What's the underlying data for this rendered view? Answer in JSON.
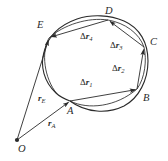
{
  "figure": {
    "background_color": "#ffffff",
    "ink_color": "#2a2a2a",
    "width": 168,
    "height": 161
  },
  "points": [
    {
      "id": "O",
      "label": "O",
      "x": 17,
      "y": 140,
      "label_x": 18,
      "label_y": 144,
      "marker": "dot"
    },
    {
      "id": "A",
      "label": "A",
      "x": 70,
      "y": 101,
      "label_x": 67,
      "label_y": 106,
      "marker": "none"
    },
    {
      "id": "B",
      "label": "B",
      "x": 137,
      "y": 89,
      "label_x": 143,
      "label_y": 93,
      "marker": "none"
    },
    {
      "id": "C",
      "label": "C",
      "x": 144,
      "y": 47,
      "label_x": 150,
      "label_y": 37,
      "marker": "none"
    },
    {
      "id": "D",
      "label": "D",
      "x": 108,
      "y": 20,
      "label_x": 105,
      "label_y": 6,
      "marker": "none"
    },
    {
      "id": "E",
      "label": "E",
      "x": 49,
      "y": 38,
      "label_x": 37,
      "label_y": 20,
      "marker": "none"
    }
  ],
  "displacement_vectors": [
    {
      "id": "dr1",
      "symbol": "Δ",
      "base": "r",
      "subscript": "1",
      "from": "A",
      "to": "B",
      "label_x": 80,
      "label_y": 78
    },
    {
      "id": "dr2",
      "symbol": "Δ",
      "base": "r",
      "subscript": "2",
      "from": "B",
      "to": "C",
      "label_x": 112,
      "label_y": 64
    },
    {
      "id": "dr3",
      "symbol": "Δ",
      "base": "r",
      "subscript": "3",
      "from": "C",
      "to": "D",
      "label_x": 110,
      "label_y": 41
    },
    {
      "id": "dr4",
      "symbol": "Δ",
      "base": "r",
      "subscript": "4",
      "from": "D",
      "to": "E",
      "label_x": 80,
      "label_y": 32
    }
  ],
  "position_vectors": [
    {
      "id": "rE",
      "base": "r",
      "subscript": "E",
      "from": "O",
      "to": "E",
      "label_x": 38,
      "label_y": 94
    },
    {
      "id": "rA",
      "base": "r",
      "subscript": "A",
      "from": "O",
      "to": "A",
      "label_x": 48,
      "label_y": 119
    }
  ],
  "curve": {
    "name": "closed-orbit-curve",
    "kind": "closed-oval",
    "center_x": 95,
    "center_y": 65,
    "radius_x": 53,
    "radius_y": 48
  }
}
